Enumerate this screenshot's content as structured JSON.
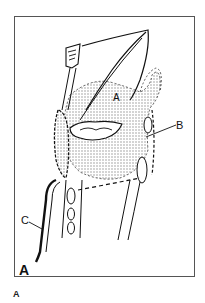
{
  "figure": {
    "panel_label": "A",
    "caption": "A",
    "labels": {
      "region_a": "A",
      "b": "B",
      "c": "C"
    },
    "colors": {
      "line": "#111111",
      "stipple": "#9a9a9a",
      "frame": "#555555",
      "background": "#ffffff"
    }
  }
}
